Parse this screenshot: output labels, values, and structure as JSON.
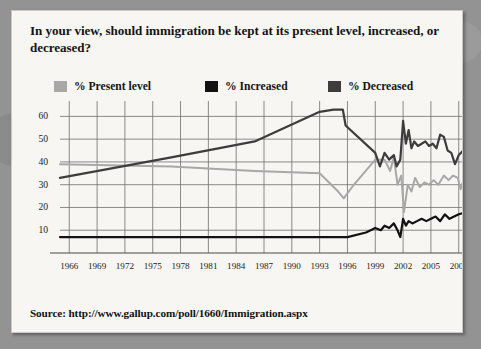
{
  "card": {
    "title": "In your view, should immigration be kept at its present level, increased, or decreased?",
    "source": "Source: http://www.gallup.com/poll/1660/Immigration.aspx"
  },
  "legend": [
    {
      "label": "% Present level",
      "color": "#a8a8a8"
    },
    {
      "label": "% Increased",
      "color": "#121212"
    },
    {
      "label": "% Decreased",
      "color": "#3d3d3d"
    }
  ],
  "chart_data": {
    "type": "line",
    "title": "In your view, should immigration be kept at its present level, increased, or decreased?",
    "xlabel": "",
    "ylabel": "",
    "xlim": [
      1965,
      2009
    ],
    "ylim": [
      0,
      65
    ],
    "grid": true,
    "legend_position": "top",
    "y_ticks": [
      10,
      20,
      30,
      40,
      50,
      60
    ],
    "x_ticks": [
      1966,
      1969,
      1972,
      1975,
      1978,
      1981,
      1984,
      1987,
      1990,
      1993,
      1996,
      1999,
      2002,
      2005,
      2008
    ],
    "series": [
      {
        "name": "% Present level",
        "color": "#a8a8a8",
        "points": [
          [
            1965,
            39
          ],
          [
            1977,
            38
          ],
          [
            1986,
            36
          ],
          [
            1993,
            35
          ],
          [
            1995,
            27
          ],
          [
            1995.6,
            24
          ],
          [
            1996.5,
            29
          ],
          [
            1999,
            41
          ],
          [
            2000,
            41
          ],
          [
            2000.6,
            36
          ],
          [
            2001,
            42
          ],
          [
            2001.4,
            30
          ],
          [
            2001.8,
            34
          ],
          [
            2002.1,
            18
          ],
          [
            2002.5,
            30
          ],
          [
            2002.9,
            27
          ],
          [
            2003.3,
            33
          ],
          [
            2003.8,
            29
          ],
          [
            2004.3,
            31
          ],
          [
            2004.8,
            30
          ],
          [
            2005.3,
            32
          ],
          [
            2005.8,
            30
          ],
          [
            2006.4,
            34
          ],
          [
            2006.9,
            32
          ],
          [
            2007.4,
            34
          ],
          [
            2007.9,
            33
          ],
          [
            2008.2,
            28
          ],
          [
            2008.6,
            33
          ],
          [
            2008.9,
            39
          ]
        ]
      },
      {
        "name": "% Decreased",
        "color": "#3d3d3d",
        "points": [
          [
            1965,
            33
          ],
          [
            1977,
            42
          ],
          [
            1986,
            49
          ],
          [
            1993,
            62
          ],
          [
            1994.5,
            63
          ],
          [
            1995.5,
            63
          ],
          [
            1995.8,
            56
          ],
          [
            1999,
            44
          ],
          [
            1999.5,
            38
          ],
          [
            2000,
            44
          ],
          [
            2000.5,
            41
          ],
          [
            2001,
            43
          ],
          [
            2001.3,
            38
          ],
          [
            2001.7,
            41
          ],
          [
            2002,
            58
          ],
          [
            2002.3,
            48
          ],
          [
            2002.6,
            54
          ],
          [
            2002.9,
            46
          ],
          [
            2003.2,
            49
          ],
          [
            2003.6,
            47
          ],
          [
            2004,
            48
          ],
          [
            2004.4,
            49
          ],
          [
            2004.8,
            47
          ],
          [
            2005.2,
            48
          ],
          [
            2005.6,
            46
          ],
          [
            2006,
            52
          ],
          [
            2006.4,
            51
          ],
          [
            2006.8,
            45
          ],
          [
            2007.2,
            44
          ],
          [
            2007.6,
            39
          ],
          [
            2008,
            43
          ],
          [
            2008.5,
            45
          ],
          [
            2008.9,
            38
          ]
        ]
      },
      {
        "name": "% Increased",
        "color": "#121212",
        "points": [
          [
            1965,
            7
          ],
          [
            1977,
            7
          ],
          [
            1986,
            7
          ],
          [
            1993,
            7
          ],
          [
            1995,
            7
          ],
          [
            1996,
            7
          ],
          [
            1998,
            9
          ],
          [
            1999,
            11
          ],
          [
            1999.6,
            10
          ],
          [
            2000,
            12
          ],
          [
            2000.5,
            11
          ],
          [
            2001,
            13
          ],
          [
            2001.4,
            10
          ],
          [
            2001.7,
            7
          ],
          [
            2002,
            15
          ],
          [
            2002.3,
            12
          ],
          [
            2002.6,
            14
          ],
          [
            2003,
            13
          ],
          [
            2003.5,
            14
          ],
          [
            2004,
            15
          ],
          [
            2004.5,
            14
          ],
          [
            2005,
            15
          ],
          [
            2005.5,
            16
          ],
          [
            2006,
            14
          ],
          [
            2006.5,
            17
          ],
          [
            2007,
            15
          ],
          [
            2007.5,
            16
          ],
          [
            2008,
            17
          ],
          [
            2008.9,
            18
          ]
        ]
      }
    ]
  }
}
